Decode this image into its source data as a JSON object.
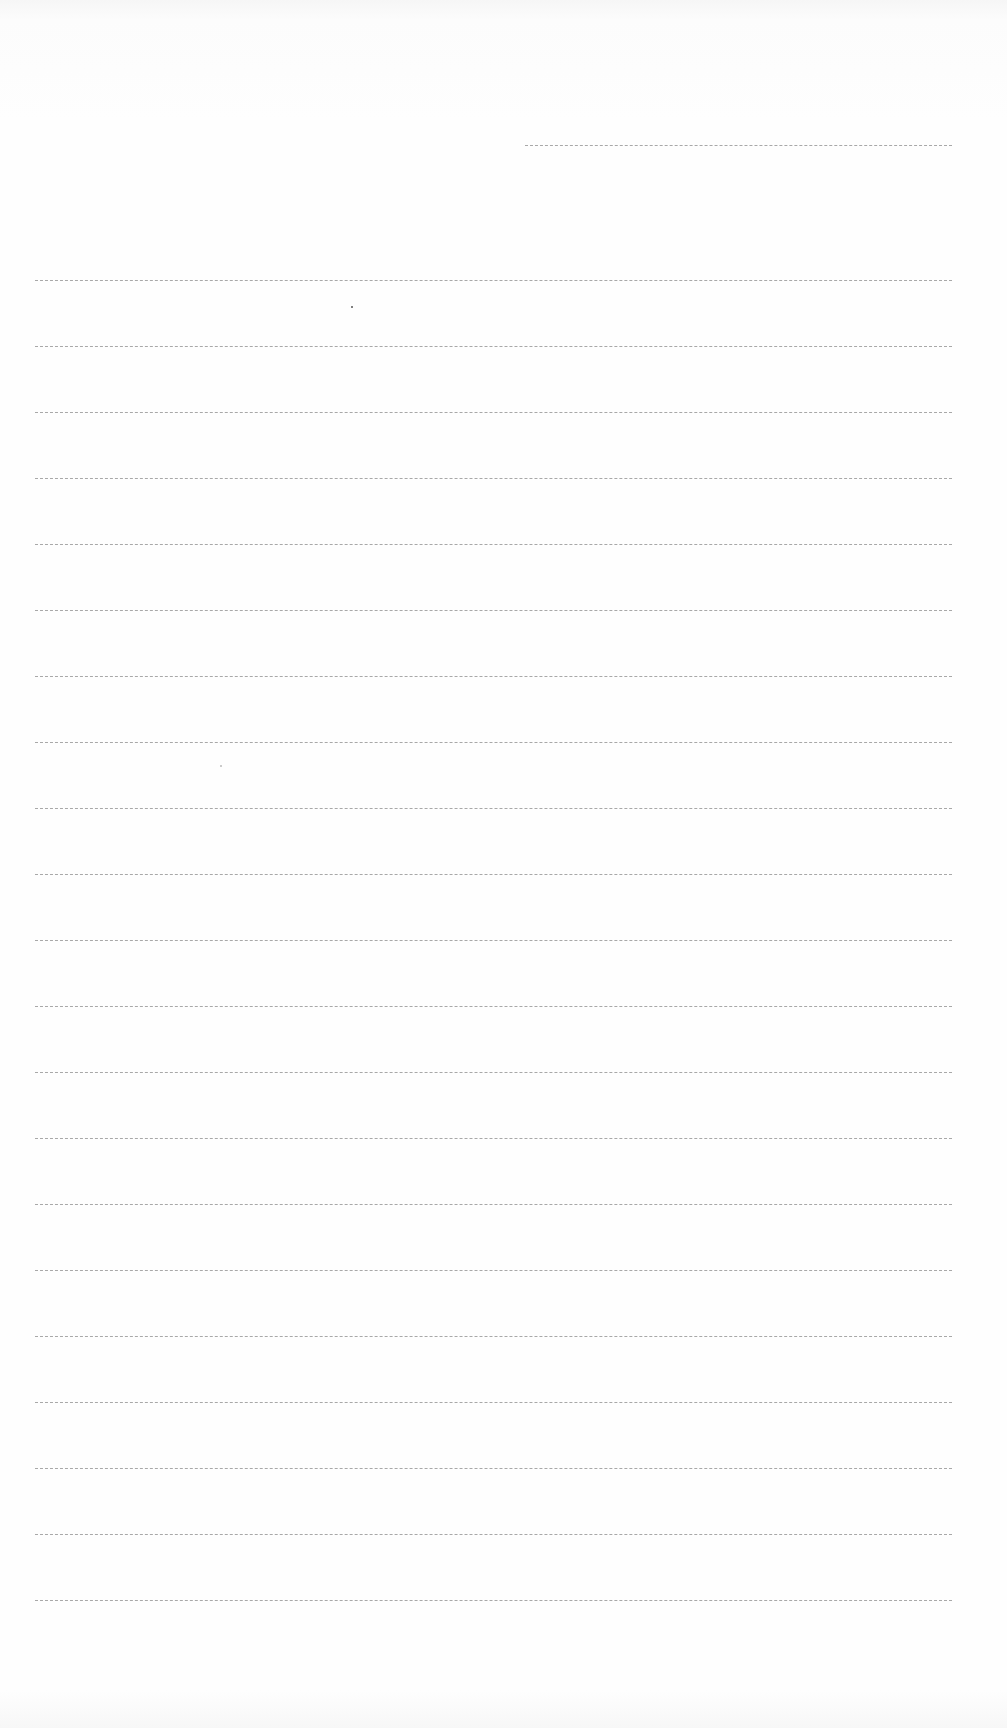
{
  "page": {
    "type": "blank lined sheet",
    "header_rule": {
      "top": 145,
      "left": 525,
      "width": 427
    },
    "rules": {
      "count": 21,
      "first_top": 280,
      "spacing": 66,
      "left": 35,
      "width": 917
    },
    "colors": {
      "paper": "#fdfdfd",
      "rule": "#9a9a9a"
    }
  }
}
